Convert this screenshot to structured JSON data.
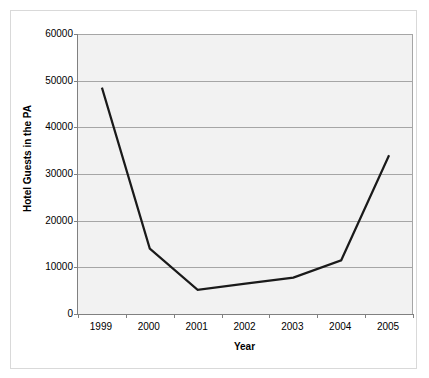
{
  "chart_data": {
    "type": "line",
    "title": "",
    "xlabel": "Year",
    "ylabel": "Hotel Guests in the PA",
    "categories": [
      "1999",
      "2000",
      "2001",
      "2002",
      "2003",
      "2004",
      "2005"
    ],
    "values": [
      48500,
      14000,
      5200,
      6500,
      7800,
      11500,
      34000
    ],
    "series": [
      {
        "name": "Hotel Guests in the PA",
        "values": [
          48500,
          14000,
          5200,
          6500,
          7800,
          11500,
          34000
        ]
      }
    ],
    "ylim": [
      0,
      60000
    ],
    "yticks": [
      0,
      10000,
      20000,
      30000,
      40000,
      50000,
      60000
    ],
    "ytick_labels": [
      "0",
      "10000",
      "20000",
      "30000",
      "40000",
      "50000",
      "60000"
    ],
    "xtick_labels": [
      "1999",
      "2000",
      "2001",
      "2002",
      "2003",
      "2004",
      "2005"
    ],
    "grid": "horizontal",
    "legend": "none",
    "line_color": "#1a1a1a",
    "plot_background": "#f2f2f2",
    "gridline_color": "#a6a6a6",
    "axis_color": "#808080"
  }
}
